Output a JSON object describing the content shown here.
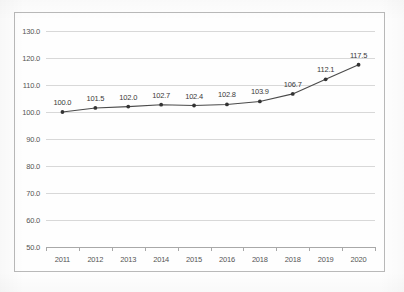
{
  "title_remnant": "",
  "chart_data": {
    "type": "line",
    "title": "",
    "xlabel": "",
    "ylabel": "",
    "categories": [
      "2011",
      "2012",
      "2013",
      "2014",
      "2015",
      "2016",
      "2018",
      "2018",
      "2019",
      "2020"
    ],
    "values": [
      100.0,
      101.5,
      102.0,
      102.7,
      102.4,
      102.8,
      103.9,
      106.7,
      112.1,
      117.5
    ],
    "point_labels": [
      "100.0",
      "101.5",
      "102.0",
      "102.7",
      "102.4",
      "102.8",
      "103.9",
      "106.7",
      "112.1",
      "117.5"
    ],
    "ylim": [
      50.0,
      130.0
    ],
    "ytick_step": 10.0,
    "ytick_labels": [
      "130.0",
      "120.0",
      "110.0",
      "100.0",
      "90.0",
      "80.0",
      "70.0",
      "60.0",
      "50.0"
    ],
    "ytick_values": [
      130.0,
      120.0,
      110.0,
      100.0,
      90.0,
      80.0,
      70.0,
      60.0,
      50.0
    ],
    "grid": "horizontal",
    "legend": "none",
    "marker": "circle",
    "series": [
      {
        "name": "",
        "values": [
          100.0,
          101.5,
          102.0,
          102.7,
          102.4,
          102.8,
          103.9,
          106.7,
          112.1,
          117.5
        ]
      }
    ],
    "colors": {
      "line": "#4a4a4a",
      "marker": "#333333",
      "grid": "#d8d8d8",
      "axis": "#a8a8a8",
      "frame": "#b9b9b9",
      "tick_text": "#555555",
      "label_text": "#3a3a3a"
    }
  }
}
